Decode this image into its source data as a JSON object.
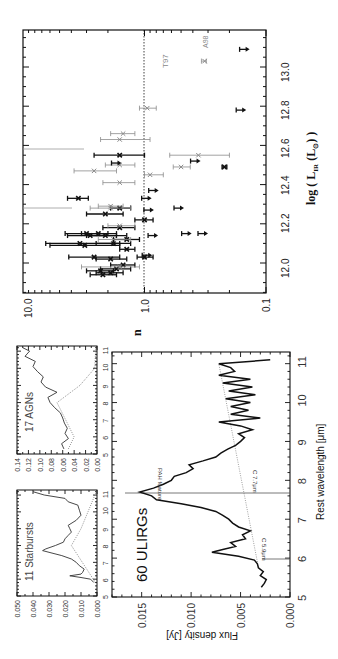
{
  "figure": {
    "orientation": "rotated-90-clockwise",
    "colors": {
      "primary": "#111111",
      "secondary": "#8a8a8a",
      "background": "#ffffff"
    }
  },
  "chart_data": [
    {
      "id": "scatter",
      "type": "scatter",
      "title": "",
      "xlabel": "log ( L_IR (L_sun) )",
      "xlabel_parts": {
        "prefix": "log ( ",
        "main": "L",
        "sub": "IR",
        "mid": " (L",
        "sub2": "⊙",
        "suffix": ") )"
      },
      "ylabel": "n",
      "xlim": [
        11.8,
        13.2
      ],
      "ylim": [
        0.1,
        10.0
      ],
      "yscale": "log",
      "x_ticks": [
        "12.0",
        "12.2",
        "12.4",
        "12.6",
        "12.8",
        "13.0"
      ],
      "y_ticks": [
        "10.0",
        "1.0",
        "0.1"
      ],
      "reference_line": {
        "y": 1.0,
        "style": "dotted"
      },
      "annotations": [
        {
          "text": "T97",
          "x": 13.03,
          "y": 0.33
        },
        {
          "text": "A98",
          "x": 13.09,
          "y": 0.15
        }
      ],
      "series": [
        {
          "name": "detections (black)",
          "color": "#111111",
          "points": [
            {
              "x": 11.94,
              "y": 2.2,
              "ylo": 1.7,
              "yhi": 2.8
            },
            {
              "x": 11.95,
              "y": 1.9,
              "ylo": 1.5,
              "yhi": 2.5
            },
            {
              "x": 11.96,
              "y": 2.3,
              "ylo": 1.8,
              "yhi": 3.0
            },
            {
              "x": 11.97,
              "y": 1.7,
              "ylo": 1.3,
              "yhi": 2.3
            },
            {
              "x": 11.99,
              "y": 1.5,
              "ylo": 1.2,
              "yhi": 1.9
            },
            {
              "x": 12.02,
              "y": 1.9,
              "ylo": 1.4,
              "yhi": 2.5
            },
            {
              "x": 12.03,
              "y": 2.6,
              "ylo": 1.6,
              "yhi": 4.2
            },
            {
              "x": 12.03,
              "y": 1.0,
              "ylo": 0.85,
              "yhi": 1.15
            },
            {
              "x": 12.07,
              "y": 1.4,
              "ylo": 1.2,
              "yhi": 1.6
            },
            {
              "x": 12.09,
              "y": 3.1,
              "ylo": 1.6,
              "yhi": 6.0
            },
            {
              "x": 12.1,
              "y": 3.4,
              "ylo": 1.6,
              "yhi": 6.5
            },
            {
              "x": 12.1,
              "y": 1.8,
              "ylo": 1.3,
              "yhi": 2.5
            },
            {
              "x": 12.12,
              "y": 1.4,
              "ylo": 1.1,
              "yhi": 1.8
            },
            {
              "x": 12.14,
              "y": 2.1,
              "ylo": 1.4,
              "yhi": 3.0
            },
            {
              "x": 12.14,
              "y": 2.8,
              "ylo": 1.7,
              "yhi": 4.3
            },
            {
              "x": 12.15,
              "y": 2.4,
              "ylo": 1.7,
              "yhi": 3.3
            },
            {
              "x": 12.15,
              "y": 3.0,
              "ylo": 2.0,
              "yhi": 4.5
            },
            {
              "x": 12.18,
              "y": 1.6,
              "ylo": 1.2,
              "yhi": 2.2
            },
            {
              "x": 12.22,
              "y": 1.0,
              "ylo": 0.85,
              "yhi": 1.2
            },
            {
              "x": 12.25,
              "y": 2.1,
              "ylo": 1.5,
              "yhi": 3.0
            },
            {
              "x": 12.28,
              "y": 1.6,
              "ylo": 1.3,
              "yhi": 1.9
            },
            {
              "x": 12.33,
              "y": 3.5,
              "ylo": 2.9,
              "yhi": 4.3
            },
            {
              "x": 12.55,
              "y": 1.6,
              "ylo": 1.0,
              "yhi": 2.6
            },
            {
              "x": 12.49,
              "y": 0.22,
              "ylo": 0.21,
              "yhi": 0.23
            }
          ]
        },
        {
          "name": "literature (grey)",
          "color": "#8a8a8a",
          "points": [
            {
              "x": 11.98,
              "y": 1.6,
              "ylo": 1.1,
              "yhi": 3.3
            },
            {
              "x": 12.12,
              "y": 1.8,
              "ylo": 1.3,
              "yhi": 2.4
            },
            {
              "x": 12.19,
              "y": 1.6,
              "ylo": 1.2,
              "yhi": 2.0
            },
            {
              "x": 12.28,
              "y": 1.9,
              "ylo": 1.3,
              "yhi": 2.8
            },
            {
              "x": 12.29,
              "y": 1.9,
              "ylo": 1.5,
              "yhi": 2.4
            },
            {
              "x": 12.41,
              "y": 1.6,
              "ylo": 1.2,
              "yhi": 2.2
            },
            {
              "x": 12.45,
              "y": 0.9,
              "ylo": 0.7,
              "yhi": 1.0
            },
            {
              "x": 12.47,
              "y": 2.6,
              "ylo": 1.7,
              "yhi": 3.8
            },
            {
              "x": 12.49,
              "y": 0.5,
              "ylo": 0.42,
              "yhi": 0.58
            },
            {
              "x": 12.5,
              "y": 1.6,
              "ylo": 1.2,
              "yhi": 2.1
            },
            {
              "x": 12.55,
              "y": 0.36,
              "ylo": 0.2,
              "yhi": 0.62
            },
            {
              "x": 12.63,
              "y": 1.6,
              "ylo": 0.9,
              "yhi": 2.3
            },
            {
              "x": 12.66,
              "y": 1.5,
              "ylo": 1.2,
              "yhi": 1.9
            },
            {
              "x": 12.79,
              "y": 0.95,
              "ylo": 0.8,
              "yhi": 1.1
            },
            {
              "x": 13.03,
              "y": 0.32,
              "ylo": 0.31,
              "yhi": 0.34
            }
          ]
        },
        {
          "name": "upper limits (arrows)",
          "color": "#111111",
          "points": [
            {
              "x": 12.04,
              "y": 0.95
            },
            {
              "x": 12.14,
              "y": 0.85
            },
            {
              "x": 12.15,
              "y": 0.45
            },
            {
              "x": 12.15,
              "y": 0.33
            },
            {
              "x": 12.27,
              "y": 0.92
            },
            {
              "x": 12.28,
              "y": 0.52
            },
            {
              "x": 12.33,
              "y": 0.96
            },
            {
              "x": 12.37,
              "y": 0.84
            },
            {
              "x": 12.51,
              "y": 1.7
            },
            {
              "x": 12.52,
              "y": 0.38
            },
            {
              "x": 12.78,
              "y": 0.16
            },
            {
              "x": 13.09,
              "y": 0.15
            }
          ]
        }
      ]
    },
    {
      "id": "ulirg-spectrum",
      "type": "line",
      "title": "60 ULIRGs",
      "xlabel": "Rest wavelength [μm]",
      "ylabel": "Flux density [Jy]",
      "xlim": [
        5,
        11.3
      ],
      "ylim": [
        0.0,
        0.018
      ],
      "x_ticks": [
        "5",
        "6",
        "7",
        "8",
        "9",
        "10",
        "11"
      ],
      "y_ticks": [
        "0.000",
        "0.005",
        "0.010",
        "0.015"
      ],
      "annotations": [
        {
          "text": "PAH feature",
          "x": 7.7
        },
        {
          "text": "C 7.7μm",
          "x": 7.7
        },
        {
          "text": "C 5.9μm",
          "x": 5.9
        }
      ],
      "series": [
        {
          "name": "mean spectrum",
          "x": [
            5.25,
            5.35,
            5.45,
            5.55,
            5.65,
            5.75,
            5.85,
            5.95,
            6.05,
            6.15,
            6.22,
            6.3,
            6.4,
            6.5,
            6.6,
            6.7,
            6.8,
            6.9,
            7.0,
            7.1,
            7.2,
            7.3,
            7.4,
            7.5,
            7.6,
            7.7,
            7.8,
            7.9,
            8.0,
            8.1,
            8.2,
            8.3,
            8.4,
            8.5,
            8.6,
            8.7,
            8.8,
            8.9,
            9.0,
            9.1,
            9.2,
            9.3,
            9.4,
            9.5,
            9.6,
            9.7,
            9.8,
            9.9,
            10.0,
            10.1,
            10.2,
            10.3,
            10.4,
            10.5,
            10.6,
            10.7,
            10.8,
            10.9,
            11.0,
            11.1
          ],
          "values": [
            0.0029,
            0.0026,
            0.0024,
            0.003,
            0.0027,
            0.0032,
            0.0033,
            0.0036,
            0.0052,
            0.0079,
            0.0068,
            0.0055,
            0.006,
            0.0045,
            0.0048,
            0.004,
            0.0052,
            0.0058,
            0.0062,
            0.0068,
            0.0075,
            0.009,
            0.011,
            0.0135,
            0.014,
            0.0152,
            0.0138,
            0.0128,
            0.012,
            0.0117,
            0.0105,
            0.0098,
            0.0102,
            0.0088,
            0.0075,
            0.007,
            0.0063,
            0.0055,
            0.005,
            0.0046,
            0.0052,
            0.0038,
            0.005,
            0.0072,
            0.003,
            0.006,
            0.0042,
            0.006,
            0.004,
            0.0065,
            0.0035,
            0.0062,
            0.0038,
            0.0068,
            0.004,
            0.0072,
            0.0056,
            0.006,
            0.0072,
            0.002
          ]
        },
        {
          "name": "continuum",
          "style": "dotted",
          "x": [
            5.9,
            11.0
          ],
          "values": [
            0.0033,
            0.0072
          ]
        }
      ]
    },
    {
      "id": "starburst-spectrum",
      "type": "line",
      "title": "11 Starbursts",
      "xlim": [
        5,
        11.3
      ],
      "ylim": [
        0.0,
        0.05
      ],
      "x_ticks": [
        "5",
        "6",
        "7",
        "8",
        "9",
        "10",
        "11"
      ],
      "y_ticks": [
        "0.000",
        "0.010",
        "0.020",
        "0.030",
        "0.040",
        "0.050"
      ],
      "series": [
        {
          "name": "mean spectrum",
          "x": [
            5.8,
            6.0,
            6.1,
            6.2,
            6.3,
            6.4,
            6.6,
            6.8,
            7.0,
            7.2,
            7.4,
            7.6,
            7.7,
            7.8,
            8.0,
            8.2,
            8.4,
            8.6,
            8.8,
            9.0,
            9.2,
            9.5,
            9.8,
            10.1,
            10.4,
            10.6,
            10.8,
            11.0,
            11.2
          ],
          "values": [
            0.002,
            0.004,
            0.01,
            0.017,
            0.01,
            0.009,
            0.008,
            0.011,
            0.013,
            0.016,
            0.022,
            0.03,
            0.034,
            0.032,
            0.026,
            0.021,
            0.02,
            0.018,
            0.016,
            0.017,
            0.018,
            0.013,
            0.01,
            0.011,
            0.012,
            0.018,
            0.02,
            0.033,
            0.04
          ]
        },
        {
          "name": "continuum",
          "style": "dotted",
          "x": [
            5.8,
            8.0,
            9.0,
            11.3
          ],
          "values": [
            0.001,
            0.016,
            0.01,
            0.0
          ]
        }
      ]
    },
    {
      "id": "agn-spectrum",
      "type": "line",
      "title": "17 AGNs",
      "xlim": [
        5,
        11.3
      ],
      "ylim": [
        0.0,
        0.14
      ],
      "x_ticks": [
        "5",
        "6",
        "7",
        "8",
        "9",
        "10",
        "11"
      ],
      "y_ticks": [
        "0.00",
        "0.02",
        "0.04",
        "0.06",
        "0.08",
        "0.10",
        "0.12",
        "0.14"
      ],
      "series": [
        {
          "name": "mean spectrum",
          "x": [
            5.3,
            5.6,
            5.9,
            6.2,
            6.5,
            6.8,
            7.1,
            7.4,
            7.7,
            8.0,
            8.3,
            8.6,
            8.9,
            9.2,
            9.5,
            9.8,
            10.1,
            10.4,
            10.7,
            11.0,
            11.2
          ],
          "values": [
            0.058,
            0.062,
            0.05,
            0.056,
            0.052,
            0.057,
            0.06,
            0.064,
            0.074,
            0.082,
            0.086,
            0.07,
            0.09,
            0.098,
            0.094,
            0.104,
            0.112,
            0.108,
            0.126,
            0.118,
            0.13
          ]
        },
        {
          "name": "continuum",
          "style": "dotted",
          "x": [
            5.3,
            6.0,
            7.0,
            8.0,
            9.0,
            10.0,
            11.3
          ],
          "values": [
            0.05,
            0.04,
            0.055,
            0.07,
            0.03,
            0.004,
            0.002
          ]
        }
      ]
    }
  ],
  "labels": {
    "scatter": {
      "x_ticks": [
        "12.0",
        "12.2",
        "12.4",
        "12.6",
        "12.8",
        "13.0"
      ],
      "y_ticks": [
        "10.0",
        "1.0",
        "0.1"
      ],
      "ylabel": "n",
      "xlabel_log": "log ( ",
      "xlabel_L": "L",
      "xlabel_sub": "IR",
      "xlabel_mid": " (L",
      "xlabel_sub2": "⊙",
      "xlabel_end": ") )",
      "t97": "T97",
      "a98": "A98"
    },
    "ulirg": {
      "title": "60 ULIRGs",
      "xlabel": "Rest wavelength [μm]",
      "ylabel": "Flux density [Jy]",
      "x_ticks": [
        "5",
        "6",
        "7",
        "8",
        "9",
        "10",
        "11"
      ],
      "y_ticks": [
        "0.015",
        "0.010",
        "0.005",
        "0.000"
      ],
      "pah": "PAH feature",
      "c77": "C 7.7μm",
      "c59": "C 5.9μm"
    },
    "starburst": {
      "title": "11 Starbursts",
      "x_ticks": [
        "5",
        "6",
        "7",
        "8",
        "9",
        "10",
        "11"
      ],
      "y_ticks": [
        "0.050",
        "0.040",
        "0.030",
        "0.020",
        "0.010",
        "0.000"
      ]
    },
    "agn": {
      "title": "17 AGNs",
      "x_ticks": [
        "5",
        "6",
        "7",
        "8",
        "9",
        "10",
        "11"
      ],
      "y_ticks": [
        "0.14",
        "0.12",
        "0.10",
        "0.08",
        "0.06",
        "0.04",
        "0.02",
        "0.00"
      ]
    }
  }
}
